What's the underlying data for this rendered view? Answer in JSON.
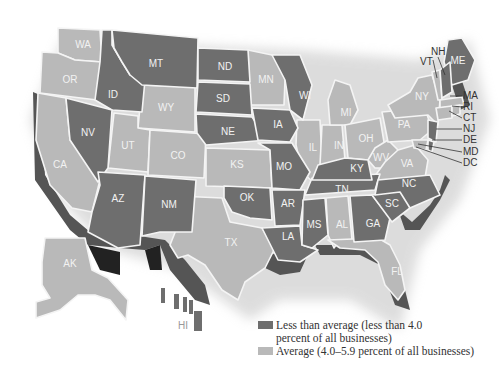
{
  "map": {
    "type": "choropleth",
    "region": "United States",
    "colors": {
      "less_than_average": "#6e6e6e",
      "average": "#b9b9b9",
      "shadow": "#4a4a4a"
    },
    "states": {
      "WA": "average",
      "OR": "average",
      "CA": "average",
      "ID": "less_than_average",
      "NV": "less_than_average",
      "MT": "less_than_average",
      "WY": "average",
      "UT": "average",
      "CO": "average",
      "AZ": "less_than_average",
      "NM": "less_than_average",
      "ND": "less_than_average",
      "SD": "less_than_average",
      "NE": "less_than_average",
      "KS": "average",
      "OK": "less_than_average",
      "TX": "average",
      "MN": "average",
      "IA": "less_than_average",
      "MO": "less_than_average",
      "AR": "less_than_average",
      "LA": "less_than_average",
      "WI": "less_than_average",
      "IL": "average",
      "MI": "average",
      "IN": "average",
      "OH": "average",
      "KY": "less_than_average",
      "TN": "less_than_average",
      "MS": "less_than_average",
      "AL": "average",
      "GA": "less_than_average",
      "FL": "average",
      "SC": "less_than_average",
      "NC": "less_than_average",
      "VA": "average",
      "WV": "average",
      "PA": "average",
      "NY": "average",
      "VT": "average",
      "NH": "less_than_average",
      "ME": "less_than_average",
      "MA": "average",
      "RI": "average",
      "CT": "average",
      "NJ": "less_than_average",
      "DE": "less_than_average",
      "MD": "average",
      "DC": "average",
      "AK": "average",
      "HI": "average"
    },
    "labels": {
      "WA": "WA",
      "OR": "OR",
      "CA": "CA",
      "ID": "ID",
      "NV": "NV",
      "MT": "MT",
      "WY": "WY",
      "UT": "UT",
      "CO": "CO",
      "AZ": "AZ",
      "NM": "NM",
      "ND": "ND",
      "SD": "SD",
      "NE": "NE",
      "KS": "KS",
      "OK": "OK",
      "TX": "TX",
      "MN": "MN",
      "IA": "IA",
      "MO": "MO",
      "AR": "AR",
      "LA": "LA",
      "WI": "WI",
      "IL": "IL",
      "MI": "MI",
      "IN": "IN",
      "OH": "OH",
      "KY": "KY",
      "TN": "TN",
      "MS": "MS",
      "AL": "AL",
      "GA": "GA",
      "FL": "FL",
      "SC": "SC",
      "NC": "NC",
      "VA": "VA",
      "WV": "WV",
      "PA": "PA",
      "NY": "NY",
      "VT": "VT",
      "NH": "NH",
      "ME": "ME",
      "MA": "MA",
      "RI": "RI",
      "CT": "CT",
      "NJ": "NJ",
      "DE": "DE",
      "MD": "MD",
      "DC": "DC",
      "AK": "AK",
      "HI": "HI"
    }
  },
  "legend": {
    "items": [
      {
        "label_line1": "Less than average (less than 4.0",
        "label_line2": "percent of all businesses)",
        "color": "#6e6e6e"
      },
      {
        "label_line1": "Average (4.0–5.9 percent of all businesses)",
        "color": "#b9b9b9"
      }
    ]
  }
}
